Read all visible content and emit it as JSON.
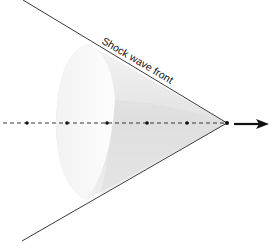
{
  "diagram": {
    "label": "Shock wave front",
    "apex": {
      "x": 227,
      "y": 123
    },
    "axis_y": 123,
    "source_positions_x": [
      27,
      67,
      107,
      147,
      187,
      227
    ],
    "arrow": {
      "from_x": 234,
      "to_x": 269
    },
    "colors": {
      "line": "#222222",
      "cone_light": "#f7f7f7",
      "cone_shadow": "#d8d8d8",
      "dots": "#111111"
    }
  }
}
